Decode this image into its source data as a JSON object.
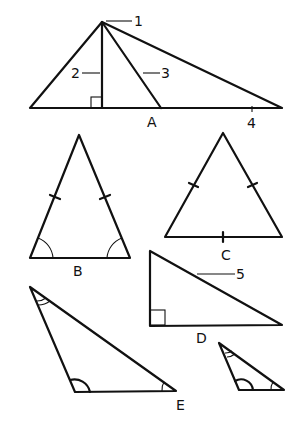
{
  "figure": {
    "triangles": [
      {
        "id": "A",
        "label": "A",
        "parts": [
          {
            "number": "1",
            "name": "vertex"
          },
          {
            "number": "2",
            "name": "altitude"
          },
          {
            "number": "3",
            "name": "median"
          },
          {
            "number": "4",
            "name": "base"
          }
        ]
      },
      {
        "id": "B",
        "label": "B",
        "type": "isosceles"
      },
      {
        "id": "C",
        "label": "C",
        "type": "equilateral"
      },
      {
        "id": "D",
        "label": "D",
        "type": "right",
        "parts": [
          {
            "number": "5",
            "name": "hypotenuse"
          }
        ]
      },
      {
        "id": "E",
        "label": "E",
        "type": "similar triangles"
      }
    ]
  },
  "labels": {
    "n1": "1",
    "n2": "2",
    "n3": "3",
    "n4": "4",
    "n5": "5",
    "A": "A",
    "B": "B",
    "C": "C",
    "D": "D",
    "E": "E"
  }
}
